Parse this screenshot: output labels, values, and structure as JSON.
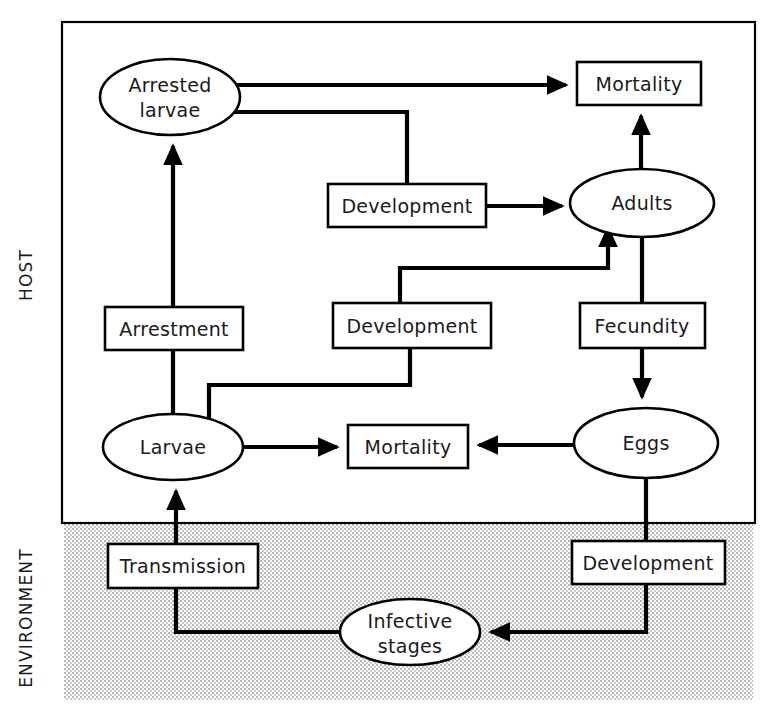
{
  "figure": {
    "type": "flow-diagram",
    "regions": [
      {
        "id": "host",
        "label": "HOST",
        "fill": "#ffffff",
        "bounds": [
          62,
          22,
          693,
          501
        ]
      },
      {
        "id": "environment",
        "label": "ENVIRONMENT",
        "fill": "#d9d9d9",
        "bounds": [
          64,
          524,
          689,
          176
        ]
      }
    ],
    "nodes": [
      {
        "id": "arrested-larvae",
        "label": "Arrested larvae",
        "lines": [
          "Arrested",
          "larvae"
        ],
        "shape": "ellipse",
        "region": "host",
        "cx": 170,
        "cy": 97,
        "rx": 70,
        "ry": 38
      },
      {
        "id": "mortality-top",
        "label": "Mortality",
        "lines": [
          "Mortality"
        ],
        "shape": "box",
        "region": "host",
        "x": 577,
        "y": 62,
        "w": 124,
        "h": 43
      },
      {
        "id": "development-upper",
        "label": "Development",
        "lines": [
          "Development"
        ],
        "shape": "box",
        "region": "host",
        "x": 328,
        "y": 184,
        "w": 158,
        "h": 43
      },
      {
        "id": "adults",
        "label": "Adults",
        "lines": [
          "Adults"
        ],
        "shape": "ellipse",
        "region": "host",
        "cx": 642,
        "cy": 203,
        "rx": 72,
        "ry": 34
      },
      {
        "id": "arrestment",
        "label": "Arrestment",
        "lines": [
          "Arrestment"
        ],
        "shape": "box",
        "region": "host",
        "x": 105,
        "y": 307,
        "w": 138,
        "h": 43
      },
      {
        "id": "development-middle",
        "label": "Development",
        "lines": [
          "Development"
        ],
        "shape": "box",
        "region": "host",
        "x": 333,
        "y": 303,
        "w": 158,
        "h": 45
      },
      {
        "id": "fecundity",
        "label": "Fecundity",
        "lines": [
          "Fecundity"
        ],
        "shape": "box",
        "region": "host",
        "x": 580,
        "y": 303,
        "w": 125,
        "h": 45
      },
      {
        "id": "larvae",
        "label": "Larvae",
        "lines": [
          "Larvae"
        ],
        "shape": "ellipse",
        "region": "host",
        "cx": 173,
        "cy": 447,
        "rx": 70,
        "ry": 33
      },
      {
        "id": "mortality-bottom",
        "label": "Mortality",
        "lines": [
          "Mortality"
        ],
        "shape": "box",
        "region": "host",
        "x": 348,
        "y": 425,
        "w": 120,
        "h": 43
      },
      {
        "id": "eggs",
        "label": "Eggs",
        "lines": [
          "Eggs"
        ],
        "shape": "ellipse",
        "region": "host",
        "cx": 646,
        "cy": 443,
        "rx": 72,
        "ry": 35
      },
      {
        "id": "transmission",
        "label": "Transmission",
        "lines": [
          "Transmission"
        ],
        "shape": "box",
        "region": "environment",
        "x": 108,
        "y": 544,
        "w": 150,
        "h": 44
      },
      {
        "id": "development-lower",
        "label": "Development",
        "lines": [
          "Development"
        ],
        "shape": "box",
        "region": "environment",
        "x": 572,
        "y": 541,
        "w": 153,
        "h": 43
      },
      {
        "id": "infective-stages",
        "label": "Infective stages",
        "lines": [
          "Infective",
          "stages"
        ],
        "shape": "ellipse",
        "region": "environment",
        "cx": 410,
        "cy": 632,
        "rx": 70,
        "ry": 33
      }
    ],
    "edges": [
      {
        "id": "arrested-larvae-to-mortality-top",
        "from": "arrested-larvae",
        "to": "mortality-top",
        "arrow": true
      },
      {
        "id": "arrested-larvae-to-development-upper",
        "from": "arrested-larvae",
        "to": "development-upper",
        "arrow": false
      },
      {
        "id": "development-upper-to-adults",
        "from": "development-upper",
        "to": "adults",
        "arrow": true
      },
      {
        "id": "adults-to-mortality-top",
        "from": "adults",
        "to": "mortality-top",
        "arrow": true
      },
      {
        "id": "arrestment-to-arrested-larvae",
        "from": "arrestment",
        "to": "arrested-larvae",
        "arrow": true
      },
      {
        "id": "larvae-to-arrestment",
        "from": "larvae",
        "to": "arrestment",
        "arrow": false
      },
      {
        "id": "larvae-to-development-middle",
        "from": "larvae",
        "to": "development-middle",
        "arrow": false
      },
      {
        "id": "development-middle-to-adults",
        "from": "development-middle",
        "to": "adults",
        "arrow": true
      },
      {
        "id": "larvae-to-mortality-bottom",
        "from": "larvae",
        "to": "mortality-bottom",
        "arrow": true
      },
      {
        "id": "eggs-to-mortality-bottom",
        "from": "eggs",
        "to": "mortality-bottom",
        "arrow": true
      },
      {
        "id": "adults-to-fecundity",
        "from": "adults",
        "to": "fecundity",
        "arrow": false
      },
      {
        "id": "fecundity-to-eggs",
        "from": "fecundity",
        "to": "eggs",
        "arrow": true
      },
      {
        "id": "eggs-to-development-lower",
        "from": "eggs",
        "to": "development-lower",
        "arrow": false
      },
      {
        "id": "development-lower-to-infective-stages",
        "from": "development-lower",
        "to": "infective-stages",
        "arrow": true
      },
      {
        "id": "infective-stages-to-transmission",
        "from": "infective-stages",
        "to": "transmission",
        "arrow": false
      },
      {
        "id": "transmission-to-larvae",
        "from": "transmission",
        "to": "larvae",
        "arrow": true
      }
    ]
  },
  "colors": {
    "stroke": "#000000",
    "node_fill": "#ffffff",
    "environment_fill": "#d9d9d9",
    "text": "#1a1a1a"
  }
}
